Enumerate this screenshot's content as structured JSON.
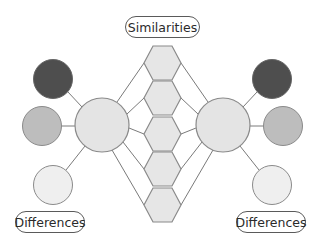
{
  "diagram": {
    "type": "double-bubble-map",
    "labels": {
      "similarities": "Similarities",
      "differences_left": "Differences",
      "differences_right": "Differences"
    },
    "colors": {
      "line": "#7a7a7a",
      "outline": "#8a8a8a",
      "hexagon_fill": "#e6e6e6",
      "main_circle_fill": "#e4e4e4",
      "dark_circle_fill": "#4e4e4e",
      "mid_circle_fill": "#bdbdbd",
      "light_circle_fill": "#efefef"
    },
    "main_topics": [
      {
        "id": "left",
        "cx": 102,
        "cy": 125,
        "r": 27
      },
      {
        "id": "right",
        "cx": 223,
        "cy": 125,
        "r": 27
      }
    ],
    "similarity_hexagons": 5,
    "difference_circles": {
      "left": [
        "dark",
        "mid",
        "light"
      ],
      "right": [
        "dark",
        "mid",
        "light"
      ]
    }
  }
}
